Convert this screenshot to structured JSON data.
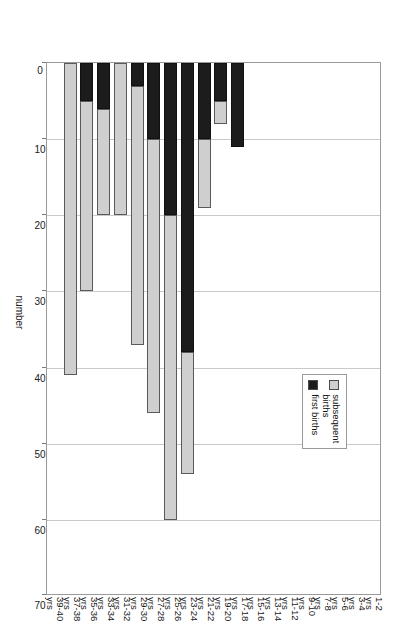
{
  "chart_data": {
    "type": "bar",
    "orientation": "rotated-90",
    "title": "",
    "xlabel": "",
    "ylabel": "number",
    "ylim": [
      0,
      70
    ],
    "yticks": [
      0,
      10,
      20,
      30,
      40,
      50,
      60,
      70
    ],
    "grid": true,
    "legend_position": "inside-left",
    "categories": [
      "1-2 yrs",
      "3-4 yrs",
      "5-6 yrs",
      "7-8 yrs",
      "9-10 yrs",
      "11-12 yrs",
      "13-14 yrs",
      "15-16 yrs",
      "17-18 yrs",
      "19-20 yrs",
      "21-22 yrs",
      "23-24 yrs",
      "25-26 yrs",
      "27-28 yrs",
      "29-30 yrs",
      "31-32 yrs",
      "33-34 yrs",
      "35-36 yrs",
      "37-38 yrs",
      "39-40 yrs"
    ],
    "category_lines": [
      [
        "1-2",
        "yrs"
      ],
      [
        "3-4",
        "yrs"
      ],
      [
        "5-6",
        "yrs"
      ],
      [
        "7-8",
        "yrs"
      ],
      [
        "9-10",
        "yrs"
      ],
      [
        "11-12",
        "yrs"
      ],
      [
        "13-14",
        "yrs"
      ],
      [
        "15-16",
        "yrs"
      ],
      [
        "17-18",
        "yrs"
      ],
      [
        "19-20",
        "yrs"
      ],
      [
        "21-22",
        "yrs"
      ],
      [
        "23-24",
        "yrs"
      ],
      [
        "25-26",
        "yrs"
      ],
      [
        "27-28",
        "yrs"
      ],
      [
        "29-30",
        "yrs"
      ],
      [
        "31-32",
        "yrs"
      ],
      [
        "33-34",
        "yrs"
      ],
      [
        "35-36",
        "yrs"
      ],
      [
        "37-38",
        "yrs"
      ],
      [
        "39-40",
        "yrs"
      ]
    ],
    "series": [
      {
        "name": "first births",
        "color": "#1c1c1c",
        "values": [
          0,
          0,
          0,
          0,
          0,
          0,
          0,
          0,
          11,
          5,
          10,
          38,
          20,
          10,
          3,
          0,
          6,
          5,
          0,
          0
        ]
      },
      {
        "name": "subsequent births",
        "color": "#cfcfcf",
        "values": [
          0,
          0,
          0,
          0,
          0,
          0,
          0,
          0,
          0,
          3,
          9,
          16,
          40,
          36,
          34,
          20,
          14,
          25,
          41,
          0
        ]
      }
    ],
    "totals": [
      0,
      0,
      0,
      0,
      0,
      0,
      0,
      0,
      11,
      8,
      19,
      54,
      60,
      46,
      37,
      20,
      20,
      30,
      41,
      0
    ]
  },
  "legend": {
    "entries": [
      {
        "label_line1": "subsequent",
        "label_line2": "births",
        "key": "subsequent births"
      },
      {
        "label_line1": "first births",
        "label_line2": "",
        "key": "first births"
      }
    ]
  },
  "axis": {
    "value_title": "number",
    "tick_labels": [
      "0",
      "10",
      "20",
      "30",
      "40",
      "50",
      "60",
      "70"
    ]
  }
}
